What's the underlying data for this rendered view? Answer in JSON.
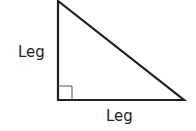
{
  "diagram": {
    "type": "right-triangle",
    "vertical_leg_label": "Leg",
    "horizontal_leg_label": "Leg",
    "right_angle_marker": true,
    "stroke_color": "#231f20",
    "vertices": {
      "top": [
        58,
        1
      ],
      "right_angle": [
        58,
        100
      ],
      "right": [
        184,
        100
      ]
    }
  }
}
